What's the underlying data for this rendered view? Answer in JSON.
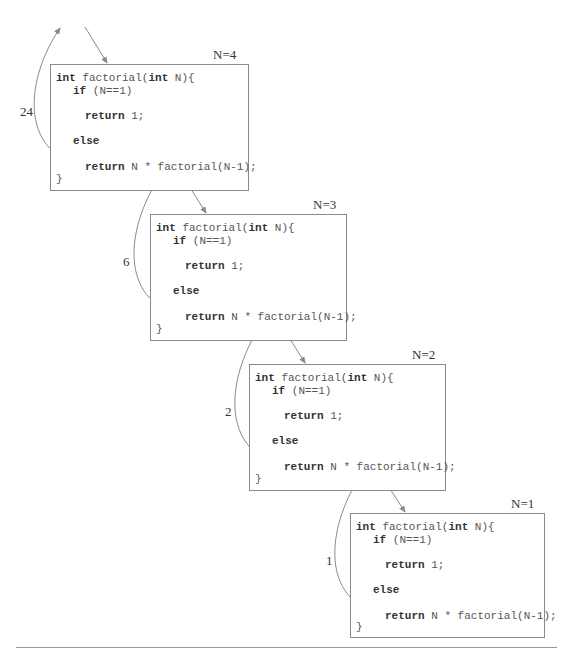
{
  "diagram": {
    "frames": [
      {
        "n_label": "N=4",
        "return_value": "24",
        "code": {
          "sig_kw1": "int",
          "sig_mid": " factorial(",
          "sig_kw2": "int",
          "sig_end": " N){",
          "if_kw": "if",
          "if_cond": " (N==1)",
          "ret1_kw": "return",
          "ret1_val": " 1;",
          "else_kw": "else",
          "ret2_kw": "return",
          "ret2_expr": " N * factorial(N-1);",
          "close": "}"
        }
      },
      {
        "n_label": "N=3",
        "return_value": "6",
        "code": {
          "sig_kw1": "int",
          "sig_mid": " factorial(",
          "sig_kw2": "int",
          "sig_end": " N){",
          "if_kw": "if",
          "if_cond": " (N==1)",
          "ret1_kw": "return",
          "ret1_val": " 1;",
          "else_kw": "else",
          "ret2_kw": "return",
          "ret2_expr": " N * factorial(N-1);",
          "close": "}"
        }
      },
      {
        "n_label": "N=2",
        "return_value": "2",
        "code": {
          "sig_kw1": "int",
          "sig_mid": " factorial(",
          "sig_kw2": "int",
          "sig_end": " N){",
          "if_kw": "if",
          "if_cond": " (N==1)",
          "ret1_kw": "return",
          "ret1_val": " 1;",
          "else_kw": "else",
          "ret2_kw": "return",
          "ret2_expr": " N * factorial(N-1);",
          "close": "}"
        }
      },
      {
        "n_label": "N=1",
        "return_value": "1",
        "code": {
          "sig_kw1": "int",
          "sig_mid": " factorial(",
          "sig_kw2": "int",
          "sig_end": " N){",
          "if_kw": "if",
          "if_cond": " (N==1)",
          "ret1_kw": "return",
          "ret1_val": " 1;",
          "else_kw": "else",
          "ret2_kw": "return",
          "ret2_expr": " N * factorial(N-1);",
          "close": "}"
        }
      }
    ],
    "colors": {
      "arrow": "#8a8a8a",
      "frame_border": "#8a8a8a",
      "keyword": "#333333",
      "code": "#555555"
    }
  }
}
